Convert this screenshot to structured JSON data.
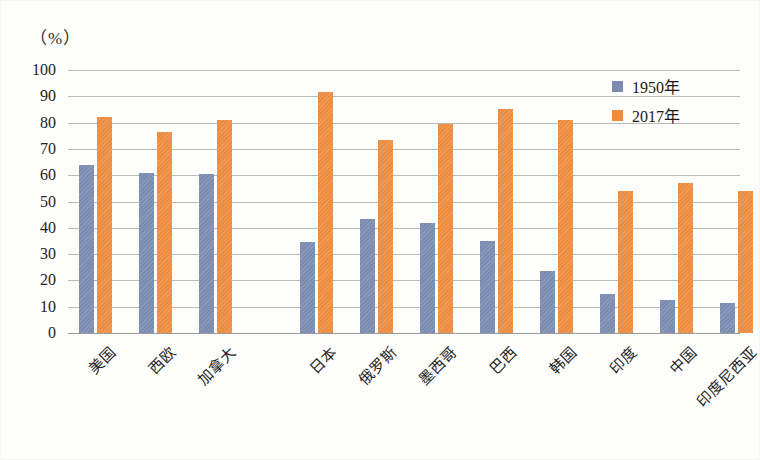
{
  "chart_data": {
    "type": "bar",
    "title": "",
    "unit_label": "（%）",
    "xlabel": "",
    "ylabel": "",
    "ylim": [
      0,
      100
    ],
    "ytick_step": 10,
    "yticks": [
      "100",
      "90",
      "80",
      "70",
      "60",
      "50",
      "40",
      "30",
      "20",
      "10",
      "0"
    ],
    "grid": true,
    "legend_position": "top-right",
    "categories": [
      "美国",
      "西欧",
      "加拿大",
      "日本",
      "俄罗斯",
      "墨西哥",
      "巴西",
      "韩国",
      "印度",
      "中国",
      "印度尼西亚"
    ],
    "series": [
      {
        "name": "1950年",
        "color": "#7b8cb0",
        "values": [
          64,
          61,
          60.5,
          34.5,
          43.5,
          42,
          35,
          23.5,
          15,
          12.5,
          11.5
        ]
      },
      {
        "name": "2017年",
        "color": "#ed8b3e",
        "values": [
          82,
          76.5,
          81,
          91.5,
          73.5,
          79.5,
          85,
          81,
          54,
          57,
          54
        ]
      }
    ]
  },
  "legend": {
    "items": [
      {
        "label": "1950年",
        "color": "#7b8cb0"
      },
      {
        "label": "2017年",
        "color": "#ed8b3e"
      }
    ]
  },
  "colors": {
    "series_1950": "#7b8cb0",
    "series_2017": "#ed8b3e",
    "gridline": "#b9b9b9",
    "text": "#232323",
    "background": "#fdfdfc"
  }
}
